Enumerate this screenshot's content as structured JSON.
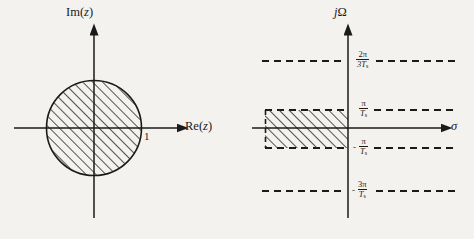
{
  "figure": {
    "title": "",
    "background_color": "#f4f2ef",
    "ink_color": "#1a1a1a"
  },
  "left_plot": {
    "name": "z-plane",
    "vertical_axis_label": "Im(z)",
    "horizontal_axis_label": "Re(z)",
    "unit_circle": {
      "label": "1",
      "radius_value": 1,
      "center": [
        94,
        128
      ],
      "radius_px": 48,
      "fill": "diagonal-hatch"
    }
  },
  "right_plot": {
    "name": "s-plane",
    "vertical_axis_label": "jΩ",
    "horizontal_axis_label": "σ",
    "origin": [
      348,
      128
    ],
    "dashed_lines": [
      {
        "id": "line-2pi-3Ts",
        "numerator": "2π",
        "denominator": "3T",
        "denominator_sub": "s",
        "sign": "",
        "y": 61,
        "label_x": 356
      },
      {
        "id": "line-pi-Ts",
        "numerator": "π",
        "denominator": "T",
        "denominator_sub": "s",
        "sign": "",
        "y": 110,
        "label_x": 357
      },
      {
        "id": "line-neg-pi-Ts",
        "numerator": "π",
        "denominator": "T",
        "denominator_sub": "s",
        "sign": "-",
        "y": 148,
        "label_x": 357
      },
      {
        "id": "line-neg-3pi-Ts",
        "numerator": "3π",
        "denominator": "T",
        "denominator_sub": "s",
        "sign": "-",
        "y": 191,
        "label_x": 356
      }
    ],
    "strip_region": {
      "id": "hatched-strip",
      "x_left": 265,
      "x_right": 348,
      "y_top": 110,
      "y_bottom": 148,
      "fill": "diagonal-hatch",
      "border": "dashed"
    }
  },
  "chart_data": {
    "type": "diagram",
    "panels": [
      {
        "name": "z-plane",
        "xlabel": "Re(z)",
        "ylabel": "Im(z)",
        "shaded_region": "interior of unit circle |z| < 1",
        "annotations": [
          "1"
        ]
      },
      {
        "name": "s-plane",
        "xlabel": "σ",
        "ylabel": "jΩ",
        "shaded_region": "left half plane strip -π/Ts < Ω < π/Ts, σ < 0",
        "gridline_values": [
          "2π/3Ts",
          "π/Ts",
          "-π/Ts",
          "-3π/Ts"
        ]
      }
    ]
  }
}
